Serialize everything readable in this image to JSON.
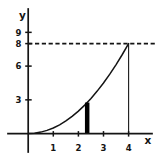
{
  "chart_data": {
    "type": "line",
    "title": "",
    "xlabel": "x",
    "ylabel": "y",
    "x_ticks": [
      1,
      2,
      3,
      4
    ],
    "y_ticks": [
      3,
      6,
      8,
      9
    ],
    "xlim": [
      -0.8,
      5.1
    ],
    "ylim": [
      -2.4,
      11.1
    ],
    "grid": false,
    "legend": "none",
    "curve_points": [
      [
        0,
        0
      ],
      [
        0.25,
        0.03
      ],
      [
        0.5,
        0.13
      ],
      [
        0.75,
        0.28
      ],
      [
        1,
        0.5
      ],
      [
        1.25,
        0.78
      ],
      [
        1.5,
        1.13
      ],
      [
        1.75,
        1.53
      ],
      [
        2,
        2
      ],
      [
        2.25,
        2.53
      ],
      [
        2.5,
        3.13
      ],
      [
        2.75,
        3.78
      ],
      [
        3,
        4.5
      ],
      [
        3.25,
        5.28
      ],
      [
        3.5,
        6.13
      ],
      [
        3.75,
        7.03
      ],
      [
        4,
        8
      ]
    ],
    "dashed_line_y": 8,
    "vertical_line_x": 4,
    "ordinate_bar": {
      "x": 2.35,
      "y_top": 2.76
    },
    "annotations": [
      "dashed horizontal line at y = 8 from y-axis to right edge, meeting curve at x = 4",
      "thin vertical line at x = 4 from x-axis up to curve at y = 8",
      "thick vertical ordinate bar near x = 2.4 from x-axis up to curve (height about 3)"
    ]
  }
}
